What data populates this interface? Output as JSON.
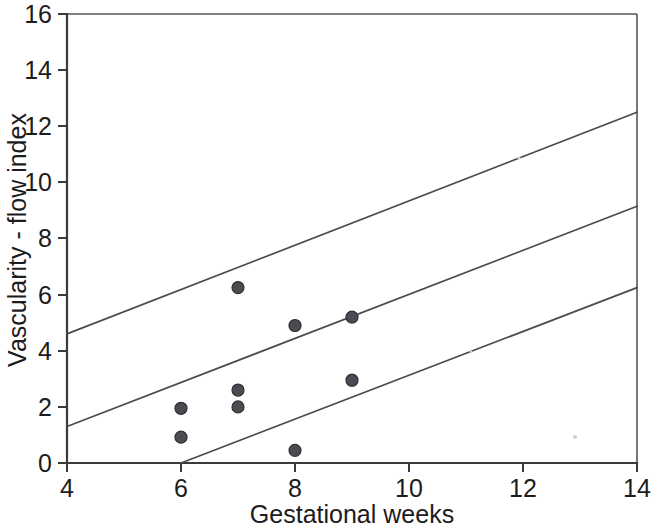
{
  "chart_data": {
    "type": "scatter",
    "title": "",
    "xlabel": "Gestational weeks",
    "ylabel": "Vascularity - flow index",
    "xlim": [
      4,
      14
    ],
    "ylim": [
      0,
      16
    ],
    "xticks": [
      4,
      6,
      8,
      10,
      12,
      14
    ],
    "yticks": [
      0,
      2,
      4,
      6,
      8,
      10,
      12,
      14,
      16
    ],
    "grid": false,
    "legend": null,
    "points": [
      {
        "x": 6.0,
        "y": 1.95
      },
      {
        "x": 6.0,
        "y": 0.92
      },
      {
        "x": 7.0,
        "y": 6.25
      },
      {
        "x": 7.0,
        "y": 2.6
      },
      {
        "x": 7.0,
        "y": 2.0
      },
      {
        "x": 8.0,
        "y": 4.9
      },
      {
        "x": 8.0,
        "y": 0.45
      },
      {
        "x": 9.0,
        "y": 5.2
      },
      {
        "x": 9.0,
        "y": 2.95
      }
    ],
    "series": [
      {
        "name": "upper-confidence-line",
        "type": "line",
        "x": [
          4,
          14
        ],
        "values": [
          4.6,
          12.5
        ]
      },
      {
        "name": "regression-line",
        "type": "line",
        "x": [
          4,
          14
        ],
        "values": [
          1.3,
          9.15
        ]
      },
      {
        "name": "lower-confidence-line",
        "type": "line",
        "x": [
          6,
          14
        ],
        "values": [
          0.0,
          6.25
        ]
      }
    ],
    "marker_radius_px": 6,
    "colors": {
      "marker_fill": "#4b4b52",
      "marker_stroke": "#2e2e33",
      "line": "#4a4a52",
      "axis": "#3a3a3a",
      "text": "#1c1c1c",
      "background": "#ffffff"
    }
  },
  "axes": {
    "x": {
      "label": "Gestational weeks",
      "tick_labels": [
        "4",
        "6",
        "8",
        "10",
        "12",
        "14"
      ]
    },
    "y": {
      "label": "Vascularity - flow index",
      "tick_labels": [
        "0",
        "2",
        "4",
        "6",
        "8",
        "10",
        "12",
        "14",
        "16"
      ]
    }
  }
}
